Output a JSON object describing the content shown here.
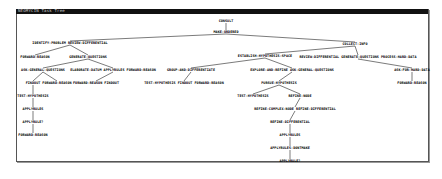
{
  "window": {
    "title": "NEOMYCIN Task Tree"
  },
  "tree": {
    "line_color": "#222222",
    "nodes": [
      {
        "id": "n0",
        "label": "CONSULT",
        "x": 226,
        "y": 20
      },
      {
        "id": "n1",
        "label": "MAKE-ORDERED",
        "x": 226,
        "y": 31
      },
      {
        "id": "n2",
        "label": "IDENTIFY-PROBLEM REVIEW-DIFFERENTIAL",
        "x": 70,
        "y": 42
      },
      {
        "id": "n3",
        "label": "COLLECT-INFO",
        "x": 355,
        "y": 43
      },
      {
        "id": "n4",
        "label": "FORWARD-REASON",
        "x": 35,
        "y": 56
      },
      {
        "id": "n5",
        "label": "GENERATE-QUESTIONS",
        "x": 88,
        "y": 56
      },
      {
        "id": "n6",
        "label": "ESTABLISH-HYPOTHESIS-SPACE",
        "x": 265,
        "y": 55
      },
      {
        "id": "n7",
        "label": "REVIEW-DIFFERENTIAL GENERATE-QUESTIONS PROCESS-HARD-DATA",
        "x": 358,
        "y": 56
      },
      {
        "id": "n8",
        "label": "ASK-GENERAL-QUESTIONS",
        "x": 43,
        "y": 69
      },
      {
        "id": "n9",
        "label": "ELABORATE-DATUM APPLYRULES FORWARD-REASON",
        "x": 113,
        "y": 69
      },
      {
        "id": "n10",
        "label": "GROUP-AND-DIFFERENTIATE",
        "x": 191,
        "y": 69
      },
      {
        "id": "n11",
        "label": "EXPLORE-AND-REFINE ASK-GENERAL-QUESTIONS",
        "x": 292,
        "y": 69
      },
      {
        "id": "n12",
        "label": "ASK-FOR-HARD-DATA",
        "x": 412,
        "y": 69
      },
      {
        "id": "n13",
        "label": "FINDOUT",
        "x": 33,
        "y": 82
      },
      {
        "id": "n14",
        "label": "FORWARD-REASON",
        "x": 57,
        "y": 82
      },
      {
        "id": "n15",
        "label": "FORWARD-REASON FINDOUT",
        "x": 96,
        "y": 82
      },
      {
        "id": "n16",
        "label": "TEST-HYPOTHESIS FINDOUT FORWARD-REASON",
        "x": 184,
        "y": 82
      },
      {
        "id": "n17",
        "label": "PURSUE-HYPOTHESIS",
        "x": 279,
        "y": 82
      },
      {
        "id": "n18",
        "label": "FORWARD-REASON",
        "x": 412,
        "y": 82
      },
      {
        "id": "n19",
        "label": "TEST-HYPOTHESIS",
        "x": 33,
        "y": 95
      },
      {
        "id": "n20",
        "label": "TEST-HYPOTHESIS",
        "x": 253,
        "y": 95
      },
      {
        "id": "n21",
        "label": "REFINE-NODE",
        "x": 300,
        "y": 95
      },
      {
        "id": "n22",
        "label": "APPLYRULES",
        "x": 33,
        "y": 108
      },
      {
        "id": "n23",
        "label": "REFINE-COMPLEX-NODE REFINE-DIFFERENTIAL",
        "x": 295,
        "y": 108
      },
      {
        "id": "n24",
        "label": "APPLYRULE?",
        "x": 33,
        "y": 121
      },
      {
        "id": "n25",
        "label": "REFINE-DIFFERENTIAL",
        "x": 290,
        "y": 121
      },
      {
        "id": "n26",
        "label": "FORWARD-REASON",
        "x": 33,
        "y": 134
      },
      {
        "id": "n27",
        "label": "APPLYRULES",
        "x": 290,
        "y": 134
      },
      {
        "id": "n28",
        "label": "APPLYRULES-DONTMAKE",
        "x": 290,
        "y": 147
      },
      {
        "id": "n29",
        "label": "APPLYRULE?",
        "x": 290,
        "y": 160
      }
    ],
    "edges": [
      [
        "n0",
        "n1"
      ],
      [
        "n1",
        "n2"
      ],
      [
        "n1",
        "n3"
      ],
      [
        "n2",
        "n4"
      ],
      [
        "n2",
        "n5"
      ],
      [
        "n3",
        "n6"
      ],
      [
        "n3",
        "n7"
      ],
      [
        "n5",
        "n8"
      ],
      [
        "n5",
        "n9"
      ],
      [
        "n6",
        "n10"
      ],
      [
        "n6",
        "n11"
      ],
      [
        "n7",
        "n12"
      ],
      [
        "n8",
        "n13"
      ],
      [
        "n8",
        "n14"
      ],
      [
        "n9",
        "n15"
      ],
      [
        "n10",
        "n16"
      ],
      [
        "n11",
        "n17"
      ],
      [
        "n12",
        "n18"
      ],
      [
        "n13",
        "n19"
      ],
      [
        "n17",
        "n20"
      ],
      [
        "n17",
        "n21"
      ],
      [
        "n19",
        "n22"
      ],
      [
        "n21",
        "n23"
      ],
      [
        "n22",
        "n24"
      ],
      [
        "n23",
        "n25"
      ],
      [
        "n24",
        "n26"
      ],
      [
        "n25",
        "n27"
      ],
      [
        "n27",
        "n28"
      ],
      [
        "n28",
        "n29"
      ]
    ]
  }
}
